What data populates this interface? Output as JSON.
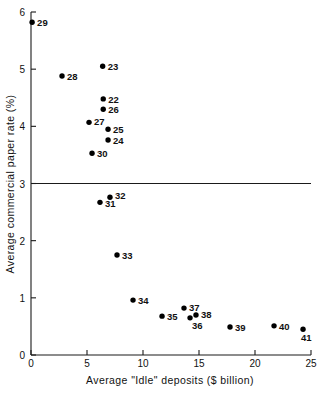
{
  "chart_data": {
    "type": "scatter",
    "title": "",
    "xlabel": "Average \"Idle\" deposits ($ billion)",
    "ylabel": "Average commercial paper rate (%)",
    "xlim": [
      0,
      25
    ],
    "ylim": [
      0,
      6
    ],
    "xticks": [
      0,
      5,
      10,
      15,
      20,
      25
    ],
    "yticks": [
      0,
      1,
      2,
      3,
      4,
      5,
      6
    ],
    "xticklabels": [
      "0",
      "5",
      "10",
      "15",
      "20",
      "25"
    ],
    "yticklabels": [
      "0",
      "1",
      "2",
      "3",
      "4",
      "5",
      "6"
    ],
    "grid": false,
    "legend": "none",
    "annotations": [
      {
        "name": "reference-line-3-percent",
        "type": "hline",
        "y": 3.0,
        "label": ""
      }
    ],
    "point_label_position": "right",
    "points": [
      {
        "label": "29",
        "x": 0.1,
        "y": 5.82,
        "label_dx": 5,
        "label_dy": 4
      },
      {
        "label": "23",
        "x": 6.4,
        "y": 5.05,
        "label_dx": 5,
        "label_dy": 4
      },
      {
        "label": "28",
        "x": 2.77,
        "y": 4.88,
        "label_dx": 5,
        "label_dy": 4
      },
      {
        "label": "22",
        "x": 6.45,
        "y": 4.48,
        "label_dx": 5,
        "label_dy": 4
      },
      {
        "label": "26",
        "x": 6.45,
        "y": 4.3,
        "label_dx": 5,
        "label_dy": 4
      },
      {
        "label": "27",
        "x": 5.18,
        "y": 4.07,
        "label_dx": 5,
        "label_dy": 3
      },
      {
        "label": "25",
        "x": 6.88,
        "y": 3.95,
        "label_dx": 5,
        "label_dy": 4
      },
      {
        "label": "24",
        "x": 6.88,
        "y": 3.76,
        "label_dx": 5,
        "label_dy": 4
      },
      {
        "label": "30",
        "x": 5.45,
        "y": 3.53,
        "label_dx": 5,
        "label_dy": 4
      },
      {
        "label": "32",
        "x": 7.05,
        "y": 2.76,
        "label_dx": 5,
        "label_dy": 2
      },
      {
        "label": "31",
        "x": 6.16,
        "y": 2.67,
        "label_dx": 5,
        "label_dy": 5
      },
      {
        "label": "33",
        "x": 7.68,
        "y": 1.75,
        "label_dx": 5,
        "label_dy": 4
      },
      {
        "label": "34",
        "x": 9.11,
        "y": 0.96,
        "label_dx": 5,
        "label_dy": 4
      },
      {
        "label": "35",
        "x": 11.7,
        "y": 0.68,
        "label_dx": 5,
        "label_dy": 4
      },
      {
        "label": "37",
        "x": 13.66,
        "y": 0.82,
        "label_dx": 5,
        "label_dy": 3
      },
      {
        "label": "36",
        "x": 14.2,
        "y": 0.65,
        "label_dx": 2,
        "label_dy": 11
      },
      {
        "label": "38",
        "x": 14.73,
        "y": 0.7,
        "label_dx": 5,
        "label_dy": 3
      },
      {
        "label": "39",
        "x": 17.77,
        "y": 0.49,
        "label_dx": 5,
        "label_dy": 4
      },
      {
        "label": "40",
        "x": 21.7,
        "y": 0.51,
        "label_dx": 5,
        "label_dy": 4
      },
      {
        "label": "41",
        "x": 24.29,
        "y": 0.45,
        "label_dx": -2,
        "label_dy": 12
      }
    ]
  },
  "colors": {
    "point": "#000000",
    "axis": "#1a1a1a",
    "text": "#111111",
    "background": "#ffffff"
  }
}
